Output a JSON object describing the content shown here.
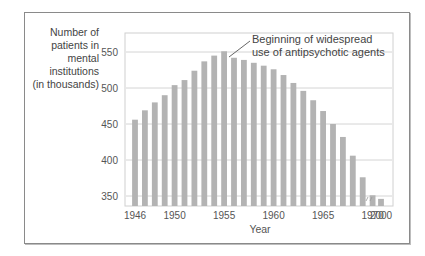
{
  "chart_data": {
    "type": "bar",
    "title": "",
    "xlabel": "Year",
    "ylabel": "Number of\npatients in\nmental\ninstitutions\n(in thousands)",
    "ylim": [
      340,
      560
    ],
    "yticks": [
      350,
      400,
      450,
      500,
      550
    ],
    "grid": true,
    "categories": [
      "1946",
      "1947",
      "1948",
      "1949",
      "1950",
      "1951",
      "1952",
      "1953",
      "1954",
      "1955",
      "1956",
      "1957",
      "1958",
      "1959",
      "1960",
      "1961",
      "1962",
      "1963",
      "1964",
      "1965",
      "1966",
      "1967",
      "1968",
      "1969",
      "1970",
      "2000"
    ],
    "xtick_labels": [
      "1946",
      "1950",
      "1955",
      "1960",
      "1965",
      "1970",
      "2000"
    ],
    "values": [
      456,
      469,
      480,
      490,
      504,
      511,
      524,
      537,
      545,
      551,
      542,
      539,
      535,
      531,
      526,
      518,
      507,
      496,
      483,
      468,
      450,
      432,
      406,
      376,
      351,
      346
    ],
    "axis_break_between": [
      "1970",
      "2000"
    ],
    "annotation": {
      "text_line1": "Beginning of widespread",
      "text_line2": "use of antipsychotic agents",
      "points_to": "1956"
    },
    "bar_color": "#b3b3b3",
    "legend": "none"
  }
}
